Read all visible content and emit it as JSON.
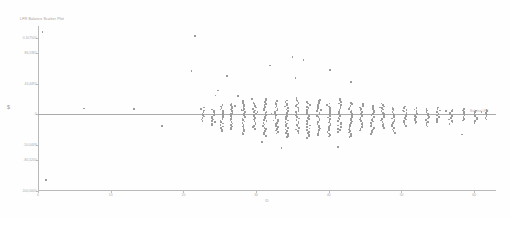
{
  "chart_data": {
    "type": "scatter",
    "title": "LFR Balance Scatter Plot",
    "xlabel": "ID",
    "ylabel": "$",
    "series_label": "Balance LFR",
    "xlim": [
      0,
      63
    ],
    "ylim": [
      -100000,
      115000
    ],
    "grid": false,
    "legend_position": "inline-right",
    "reference_line": {
      "label": "Balance LFR",
      "y": 0
    },
    "xticks": [
      0,
      10,
      20,
      30,
      40,
      50,
      60
    ],
    "xtick_labels": [
      "0",
      "10",
      "20",
      "30",
      "40",
      "50",
      "60"
    ],
    "yticks": [
      100000,
      80000,
      40000,
      0,
      -40000,
      -60000,
      -100000
    ],
    "ytick_labels": [
      "0.107500",
      "86,5382",
      "43,4492",
      "0",
      "-50,0449",
      "-80,5200",
      "-100,0000"
    ],
    "points": [
      {
        "x": 0.6,
        "y": 107000
      },
      {
        "x": 1.1,
        "y": -86000
      },
      {
        "x": 6.3,
        "y": 7400
      },
      {
        "x": 13.2,
        "y": 7100
      },
      {
        "x": 17.1,
        "y": -15500
      },
      {
        "x": 21.6,
        "y": 102000
      },
      {
        "x": 21.1,
        "y": 56500
      },
      {
        "x": 26.0,
        "y": 49500
      },
      {
        "x": 24.8,
        "y": 31000
      },
      {
        "x": 24.4,
        "y": 24500
      },
      {
        "x": 27.5,
        "y": 23900
      },
      {
        "x": 28.0,
        "y": 5200
      },
      {
        "x": 29.4,
        "y": 19800
      },
      {
        "x": 30.2,
        "y": 2600
      },
      {
        "x": 27.1,
        "y": 10700
      },
      {
        "x": 30.8,
        "y": -36000
      },
      {
        "x": 31.9,
        "y": 63500
      },
      {
        "x": 32.1,
        "y": 1100
      },
      {
        "x": 32.4,
        "y": -8000
      },
      {
        "x": 33.5,
        "y": -44000
      },
      {
        "x": 35.0,
        "y": 75000
      },
      {
        "x": 35.4,
        "y": 47000
      },
      {
        "x": 36.5,
        "y": 70500
      },
      {
        "x": 38.9,
        "y": 5500
      },
      {
        "x": 40.2,
        "y": 58000
      },
      {
        "x": 41.3,
        "y": -43000
      },
      {
        "x": 43.1,
        "y": 42000
      },
      {
        "x": 47.0,
        "y": 9000
      },
      {
        "x": 50.2,
        "y": 5000
      },
      {
        "x": 56.1,
        "y": 4200
      },
      {
        "x": 58.3,
        "y": -26500
      },
      {
        "x": 61.0,
        "y": 3000
      }
    ],
    "columns": [
      {
        "x": 22.6,
        "ymin": -9000,
        "ymax": 9000,
        "n": 10
      },
      {
        "x": 24.1,
        "ymin": -14000,
        "ymax": 6000,
        "n": 12
      },
      {
        "x": 25.3,
        "ymin": -22000,
        "ymax": 12000,
        "n": 18
      },
      {
        "x": 26.6,
        "ymin": -20000,
        "ymax": 14000,
        "n": 18
      },
      {
        "x": 28.3,
        "ymin": -26000,
        "ymax": 17000,
        "n": 22
      },
      {
        "x": 29.8,
        "ymin": -19000,
        "ymax": 15000,
        "n": 18
      },
      {
        "x": 31.2,
        "ymin": -28000,
        "ymax": 20000,
        "n": 24
      },
      {
        "x": 32.8,
        "ymin": -25000,
        "ymax": 17000,
        "n": 22
      },
      {
        "x": 34.2,
        "ymin": -30000,
        "ymax": 18000,
        "n": 25
      },
      {
        "x": 35.7,
        "ymin": -24000,
        "ymax": 21000,
        "n": 23
      },
      {
        "x": 37.2,
        "ymin": -31000,
        "ymax": 16000,
        "n": 24
      },
      {
        "x": 38.6,
        "ymin": -27000,
        "ymax": 19000,
        "n": 23
      },
      {
        "x": 40.0,
        "ymin": -29000,
        "ymax": 14000,
        "n": 22
      },
      {
        "x": 41.5,
        "ymin": -23000,
        "ymax": 20000,
        "n": 22
      },
      {
        "x": 43.0,
        "ymin": -30000,
        "ymax": 15000,
        "n": 23
      },
      {
        "x": 44.5,
        "ymin": -21000,
        "ymax": 13000,
        "n": 18
      },
      {
        "x": 46.0,
        "ymin": -26000,
        "ymax": 11000,
        "n": 19
      },
      {
        "x": 47.4,
        "ymin": -18000,
        "ymax": 14000,
        "n": 17
      },
      {
        "x": 48.9,
        "ymin": -24000,
        "ymax": 9000,
        "n": 17
      },
      {
        "x": 50.5,
        "ymin": -15000,
        "ymax": 10000,
        "n": 13
      },
      {
        "x": 52.0,
        "ymin": -12000,
        "ymax": 8000,
        "n": 11
      },
      {
        "x": 53.6,
        "ymin": -16000,
        "ymax": 7000,
        "n": 12
      },
      {
        "x": 55.1,
        "ymin": -10000,
        "ymax": 9000,
        "n": 10
      },
      {
        "x": 56.8,
        "ymin": -13000,
        "ymax": 6000,
        "n": 10
      },
      {
        "x": 58.5,
        "ymin": -8000,
        "ymax": 7000,
        "n": 8
      },
      {
        "x": 60.2,
        "ymin": -11000,
        "ymax": 5000,
        "n": 8
      },
      {
        "x": 61.6,
        "ymin": -7000,
        "ymax": 6000,
        "n": 7
      }
    ]
  }
}
